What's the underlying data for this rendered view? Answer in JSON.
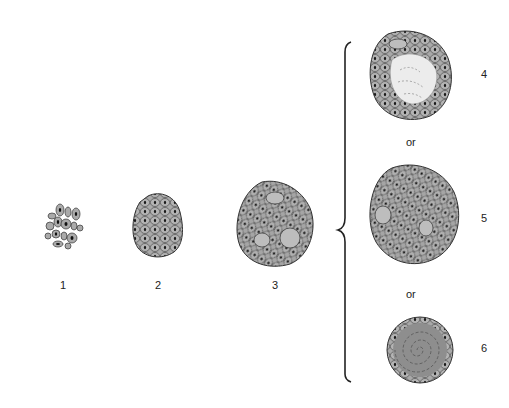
{
  "diagram": {
    "stages": [
      {
        "label": "1",
        "description": "loose cluster of individual cells"
      },
      {
        "label": "2",
        "description": "compact aggregate of cells"
      },
      {
        "label": "3",
        "description": "larger aggregate with giant cells"
      },
      {
        "label": "4",
        "description": "aggregate with necrotic center"
      },
      {
        "label": "5",
        "description": "large cellular aggregate with giant cells"
      },
      {
        "label": "6",
        "description": "fibrotic whorled aggregate with thin cell rim"
      }
    ],
    "connectors": {
      "or_1": "or",
      "or_2": "or"
    },
    "colors": {
      "cell_fill": "#a9a9a9",
      "nucleus": "#1a1a1a",
      "outline": "#333333",
      "necrosis": "#e6e6e6",
      "fibrosis": "#8e8e8e"
    }
  }
}
